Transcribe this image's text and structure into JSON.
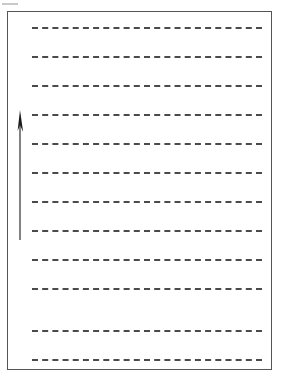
{
  "page": {
    "width": 282,
    "height": 382,
    "background_color": "#ffffff"
  },
  "sheet": {
    "frame": {
      "x": 7,
      "y": 11,
      "width": 265,
      "height": 359,
      "border_color": "#555555",
      "border_width": 1,
      "fill_color": "#ffffff"
    },
    "edge_mark": {
      "x": 2,
      "y": 3,
      "width": 16,
      "height": 2,
      "color": "#c9c9c9"
    }
  },
  "rules": {
    "count": 12,
    "color": "#4a4a4a",
    "thickness": 2,
    "dash_length": 8,
    "gap_length": 5,
    "start_x": 32,
    "end_x": 262,
    "line_width": 230,
    "spacing": 29,
    "y_positions": [
      27,
      56,
      85,
      114,
      143,
      172,
      201,
      230,
      259,
      288,
      330,
      359
    ]
  },
  "arrow": {
    "label": "upward-direction-arrow",
    "color": "#1a1a1a",
    "x": 20,
    "tail_y": 240,
    "tip_y": 110,
    "shaft_width": 1,
    "head_width": 6,
    "head_height": 22
  }
}
